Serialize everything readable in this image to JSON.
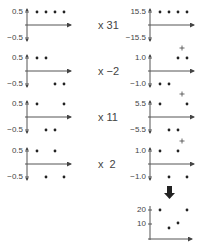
{
  "left_panels": [
    {
      "top_label": "0.5",
      "bottom_label": "−0.5",
      "points": [
        0.5,
        0.5,
        0.5,
        0.5
      ]
    },
    {
      "top_label": "0.5",
      "bottom_label": "−0.5",
      "points": [
        0.5,
        0.5,
        -0.5,
        -0.5
      ]
    },
    {
      "top_label": "0.5",
      "bottom_label": "−0.5",
      "points": [
        0.5,
        -0.5,
        -0.5,
        0.5
      ]
    },
    {
      "top_label": "0.5",
      "bottom_label": "−0.5",
      "points": [
        0.5,
        -0.5,
        0.5,
        -0.5
      ]
    }
  ],
  "multipliers": [
    "x 31",
    "x −2",
    "x 11",
    "x  2"
  ],
  "right_panels": [
    {
      "top_label": "15.5",
      "bottom_label": "−15.5",
      "points": [
        15.5,
        15.5,
        15.5,
        15.5
      ],
      "plus": false
    },
    {
      "top_label": "1.0",
      "bottom_label": "−1.0",
      "points": [
        -1.0,
        -1.0,
        1.0,
        1.0
      ],
      "plus": true
    },
    {
      "top_label": "5.5",
      "bottom_label": "−5.5",
      "points": [
        5.5,
        -5.5,
        -5.5,
        5.5
      ],
      "plus": true
    },
    {
      "top_label": "1.0",
      "bottom_label": "−1.0",
      "points": [
        1.0,
        -1.0,
        1.0,
        -1.0
      ],
      "plus": true
    }
  ],
  "arrow": "down-arrow",
  "result_panel": {
    "tick_labels": [
      "20",
      "10"
    ],
    "points": [
      20,
      8,
      11,
      20
    ]
  },
  "chart_data": {
    "type": "scatter",
    "title": "",
    "inputs": [
      [
        0.5,
        0.5,
        0.5,
        0.5
      ],
      [
        0.5,
        0.5,
        -0.5,
        -0.5
      ],
      [
        0.5,
        -0.5,
        -0.5,
        0.5
      ],
      [
        0.5,
        -0.5,
        0.5,
        -0.5
      ]
    ],
    "multipliers": [
      31,
      -2,
      11,
      2
    ],
    "scaled": [
      [
        15.5,
        15.5,
        15.5,
        15.5
      ],
      [
        -1,
        -1,
        1,
        1
      ],
      [
        5.5,
        -5.5,
        -5.5,
        5.5
      ],
      [
        1,
        -1,
        1,
        -1
      ]
    ],
    "sum": [
      21,
      8,
      12,
      20
    ],
    "result_ticks": [
      10,
      20
    ]
  }
}
